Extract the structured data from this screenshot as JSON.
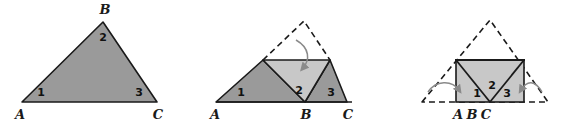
{
  "figure": {
    "colors": {
      "dark_fill": "#9a9a9a",
      "light_fill": "#c8c8c8",
      "stroke": "#1a1a1a",
      "dashed_stroke": "#1a1a1a",
      "arrow": "#8a8a8a",
      "background": "#ffffff"
    },
    "panels": [
      {
        "id": "panel-1",
        "name": "original-triangle",
        "vertices": {
          "A": {
            "label": "A",
            "x": 22,
            "y": 102
          },
          "B": {
            "label": "B",
            "x": 103,
            "y": 22
          },
          "C": {
            "label": "C",
            "x": 157,
            "y": 102
          }
        },
        "angles": [
          {
            "label": "1",
            "x": 41,
            "y": 96
          },
          {
            "label": "2",
            "x": 103,
            "y": 38
          },
          {
            "label": "3",
            "x": 138,
            "y": 96
          }
        ],
        "vertex_labels": [
          {
            "label": "A",
            "x": 20,
            "y": 117
          },
          {
            "label": "B",
            "x": 104,
            "y": 13
          },
          {
            "label": "C",
            "x": 157,
            "y": 117
          }
        ]
      },
      {
        "id": "panel-2",
        "name": "folded-triangle",
        "vertices": {
          "A": {
            "label": "A",
            "x": 216,
            "y": 102
          },
          "B": {
            "label": "B",
            "x": 305,
            "y": 102
          },
          "C": {
            "label": "C",
            "x": 347,
            "y": 102
          }
        },
        "apex_dashed": {
          "x": 304,
          "y": 21
        },
        "midline_y": 60,
        "midline_left_x": 263,
        "midline_right_x": 330,
        "angles": [
          {
            "label": "1",
            "x": 241,
            "y": 96
          },
          {
            "label": "2",
            "x": 298,
            "y": 92
          },
          {
            "label": "3",
            "x": 332,
            "y": 96
          }
        ],
        "vertex_labels": [
          {
            "label": "A",
            "x": 214,
            "y": 117
          },
          {
            "label": "B",
            "x": 305,
            "y": 117
          },
          {
            "label": "C",
            "x": 347,
            "y": 117
          }
        ],
        "arrow": {
          "name": "fold-down-arrow"
        }
      },
      {
        "id": "panel-3",
        "name": "fully-folded-rectangle",
        "rect": {
          "left": 456,
          "right": 524,
          "top": 60,
          "bottom": 102
        },
        "apex_dashed": {
          "x": 490,
          "y": 20
        },
        "base_left_x": 422,
        "base_right_x": 548,
        "angles": [
          {
            "label": "1",
            "x": 477,
            "y": 96
          },
          {
            "label": "2",
            "x": 492,
            "y": 88
          },
          {
            "label": "3",
            "x": 508,
            "y": 96
          }
        ],
        "vertex_labels": [
          {
            "label": "A",
            "x": 457,
            "y": 117
          },
          {
            "label": "B",
            "x": 471,
            "y": 117
          },
          {
            "label": "C",
            "x": 484,
            "y": 117
          }
        ],
        "arrows": [
          {
            "name": "fold-left-arrow"
          },
          {
            "name": "fold-right-arrow"
          }
        ]
      }
    ]
  }
}
